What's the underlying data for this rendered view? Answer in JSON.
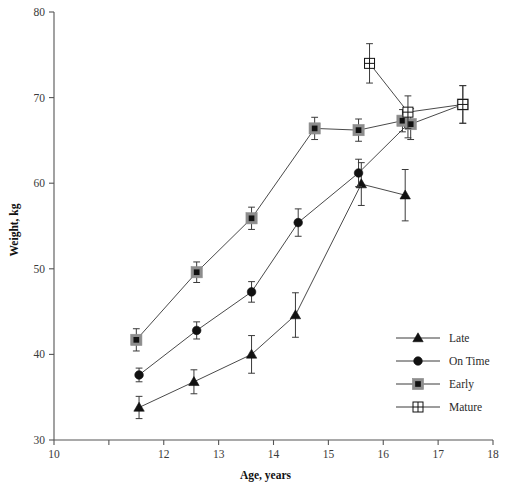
{
  "chart_data": {
    "type": "line",
    "title": "",
    "xlabel": "Age, years",
    "ylabel": "Weight, kg",
    "xlim": [
      10,
      18
    ],
    "ylim": [
      30,
      80
    ],
    "grid": false,
    "legend_position": "bottom-right",
    "xticks": [
      10,
      11,
      12,
      13,
      14,
      15,
      16,
      17,
      18
    ],
    "xtick_labels": [
      "10",
      "",
      "12",
      "13",
      "14",
      "15",
      "16",
      "17",
      "18"
    ],
    "yticks": [
      30,
      40,
      50,
      60,
      70,
      80
    ],
    "ytick_labels": [
      "30",
      "40",
      "50",
      "60",
      "70",
      "80"
    ],
    "series": [
      {
        "name": "Late",
        "marker": "filled-triangle",
        "x": [
          11.55,
          12.55,
          13.6,
          14.4,
          15.6,
          16.4
        ],
        "values": [
          33.8,
          36.8,
          40.0,
          44.6,
          59.9,
          58.6
        ],
        "yerr": [
          1.3,
          1.4,
          2.2,
          2.6,
          2.5,
          3.0
        ]
      },
      {
        "name": "On Time",
        "marker": "filled-circle",
        "x": [
          11.55,
          12.6,
          13.6,
          14.45,
          15.55,
          16.45
        ],
        "values": [
          37.6,
          42.8,
          47.3,
          55.4,
          61.2,
          66.9
        ],
        "yerr": [
          0.8,
          1.0,
          1.2,
          1.6,
          1.6,
          1.6
        ]
      },
      {
        "name": "Early",
        "marker": "filled-square",
        "x": [
          11.5,
          12.6,
          13.6,
          14.75,
          15.55,
          16.35,
          16.5,
          17.45
        ],
        "values": [
          41.7,
          49.6,
          55.9,
          66.4,
          66.2,
          67.3,
          66.9,
          69.2
        ],
        "yerr": [
          1.3,
          1.2,
          1.3,
          1.3,
          1.3,
          1.3,
          1.8,
          2.2
        ]
      },
      {
        "name": "Mature",
        "marker": "open-square",
        "x": [
          15.75,
          16.45,
          17.45
        ],
        "values": [
          74.0,
          68.3,
          69.2
        ],
        "yerr": [
          2.3,
          1.9,
          2.2
        ]
      }
    ]
  },
  "legend": {
    "entries": [
      {
        "label": "Late",
        "marker": "filled-triangle"
      },
      {
        "label": "On Time",
        "marker": "filled-circle"
      },
      {
        "label": "Early",
        "marker": "filled-square"
      },
      {
        "label": "Mature",
        "marker": "open-square"
      }
    ]
  }
}
